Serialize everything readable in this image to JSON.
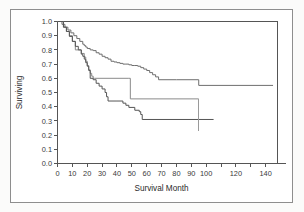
{
  "figure": {
    "kind": "kaplan-meier-survival-plot",
    "frame_color": "#8e8e8e",
    "background": "#ffffff"
  },
  "chart_data": {
    "type": "line",
    "title": "",
    "subtitle": "",
    "xlabel": "Survival Month",
    "ylabel": "Surviving",
    "xlim": [
      0,
      148
    ],
    "ylim": [
      0.0,
      1.0
    ],
    "grid": false,
    "legend": "none",
    "x_ticks": [
      0,
      10,
      20,
      30,
      40,
      50,
      60,
      70,
      80,
      90,
      100,
      110,
      120,
      130,
      140
    ],
    "x_tick_labels": [
      "0",
      "10",
      "20",
      "30",
      "40",
      "50",
      "60",
      "70",
      "80",
      "90",
      "100",
      "",
      "120",
      "",
      "140"
    ],
    "y_ticks": [
      0.0,
      0.1,
      0.2,
      0.3,
      0.4,
      0.5,
      0.6,
      0.7,
      0.8,
      0.9,
      1.0
    ],
    "y_tick_labels": [
      "0.0",
      "0.1",
      "0.2",
      "0.3",
      "0.4",
      "0.5",
      "0.6",
      "0.7",
      "0.8",
      "0.9",
      "1.0"
    ],
    "step_style": "post",
    "series": [
      {
        "name": "upper-curve",
        "color": "#6e6e6e",
        "final_value": 0.55,
        "x": [
          0,
          3,
          5,
          7,
          9,
          11,
          13,
          15,
          17,
          18,
          19,
          20,
          22,
          24,
          26,
          28,
          30,
          32,
          34,
          36,
          38,
          40,
          42,
          44,
          46,
          48,
          50,
          52,
          54,
          56,
          58,
          60,
          62,
          64,
          66,
          68,
          80,
          95,
          145
        ],
        "y": [
          1.0,
          0.98,
          0.96,
          0.94,
          0.92,
          0.9,
          0.88,
          0.86,
          0.84,
          0.83,
          0.82,
          0.81,
          0.8,
          0.795,
          0.78,
          0.77,
          0.755,
          0.745,
          0.735,
          0.72,
          0.715,
          0.71,
          0.705,
          0.7,
          0.7,
          0.695,
          0.69,
          0.69,
          0.685,
          0.675,
          0.665,
          0.655,
          0.64,
          0.625,
          0.61,
          0.59,
          0.59,
          0.55,
          0.55
        ]
      },
      {
        "name": "middle-curve",
        "color": "#8a8a8a",
        "final_value": 0.455,
        "x": [
          0,
          4,
          6,
          8,
          10,
          12,
          14,
          16,
          18,
          19,
          20,
          21,
          22,
          23,
          24,
          25,
          48,
          49,
          95
        ],
        "y": [
          1.0,
          0.96,
          0.93,
          0.9,
          0.86,
          0.8,
          0.8,
          0.775,
          0.75,
          0.72,
          0.69,
          0.66,
          0.635,
          0.615,
          0.6,
          0.6,
          0.6,
          0.455,
          0.455
        ]
      },
      {
        "name": "lower-curve",
        "color": "#555555",
        "final_value": 0.31,
        "x": [
          0,
          4,
          6,
          8,
          10,
          12,
          14,
          16,
          17,
          18,
          19,
          20,
          21,
          22,
          24,
          26,
          28,
          30,
          32,
          33,
          34,
          40,
          44,
          46,
          48,
          52,
          55,
          56,
          57,
          105
        ],
        "y": [
          1.0,
          0.96,
          0.93,
          0.895,
          0.86,
          0.825,
          0.8,
          0.77,
          0.755,
          0.735,
          0.71,
          0.685,
          0.655,
          0.6,
          0.59,
          0.565,
          0.545,
          0.525,
          0.5,
          0.47,
          0.44,
          0.44,
          0.425,
          0.41,
          0.395,
          0.375,
          0.365,
          0.345,
          0.31,
          0.31
        ]
      }
    ],
    "censor_marks": [
      {
        "series": "middle-curve",
        "x": 95,
        "y_top": 0.455,
        "y_bottom": 0.23
      }
    ]
  }
}
